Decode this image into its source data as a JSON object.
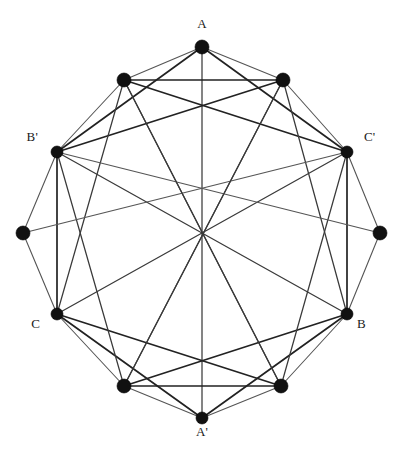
{
  "figure": {
    "type": "graph-diagram",
    "title": "",
    "background_color": "#ffffff",
    "edge_color": "#3a3a3a",
    "vertex_color": "#111111",
    "width": 402,
    "height": 469
  },
  "chart_data": {
    "type": "scatter",
    "title": "",
    "xlabel": "",
    "ylabel": "",
    "layout": {
      "center_x": 202,
      "center_y": 233,
      "radius": 186,
      "vertex_count": 12,
      "labeled_vertex_count": 6,
      "grid": false,
      "legend": "none"
    },
    "vertices": [
      {
        "id": "v0",
        "label": "A",
        "label_shown": true,
        "angle_deg": 90,
        "x": 202,
        "y": 47,
        "radius": 7.0,
        "label_x": 202,
        "label_y": 24,
        "label_anchor": "center"
      },
      {
        "id": "v1",
        "label": "",
        "label_shown": false,
        "angle_deg": 60,
        "x": 283,
        "y": 80,
        "radius": 7.0,
        "label_x": 0,
        "label_y": 0,
        "label_anchor": "center"
      },
      {
        "id": "v2",
        "label": "C'",
        "label_shown": true,
        "angle_deg": 30,
        "x": 347,
        "y": 152,
        "radius": 6.0,
        "label_x": 364,
        "label_y": 137,
        "label_anchor": "left"
      },
      {
        "id": "v3",
        "label": "",
        "label_shown": false,
        "angle_deg": 0,
        "x": 380,
        "y": 233,
        "radius": 7.0,
        "label_x": 0,
        "label_y": 0,
        "label_anchor": "center"
      },
      {
        "id": "v4",
        "label": "B",
        "label_shown": true,
        "angle_deg": -30,
        "x": 347,
        "y": 314,
        "radius": 6.0,
        "label_x": 357,
        "label_y": 324,
        "label_anchor": "left"
      },
      {
        "id": "v5",
        "label": "",
        "label_shown": false,
        "angle_deg": -60,
        "x": 281,
        "y": 386,
        "radius": 7.0,
        "label_x": 0,
        "label_y": 0,
        "label_anchor": "center"
      },
      {
        "id": "v6",
        "label": "A'",
        "label_shown": true,
        "angle_deg": -90,
        "x": 202,
        "y": 418,
        "radius": 6.0,
        "label_x": 202,
        "label_y": 432,
        "label_anchor": "center"
      },
      {
        "id": "v7",
        "label": "",
        "label_shown": false,
        "angle_deg": -120,
        "x": 124,
        "y": 386,
        "radius": 7.0,
        "label_x": 0,
        "label_y": 0,
        "label_anchor": "center"
      },
      {
        "id": "v8",
        "label": "C",
        "label_shown": true,
        "angle_deg": -150,
        "x": 57,
        "y": 314,
        "radius": 6.0,
        "label_x": 40,
        "label_y": 324,
        "label_anchor": "right"
      },
      {
        "id": "v9",
        "label": "",
        "label_shown": false,
        "angle_deg": 180,
        "x": 23,
        "y": 233,
        "radius": 7.0,
        "label_x": 0,
        "label_y": 0,
        "label_anchor": "center"
      },
      {
        "id": "v10",
        "label": "B'",
        "label_shown": true,
        "angle_deg": 150,
        "x": 57,
        "y": 152,
        "radius": 6.0,
        "label_x": 38,
        "label_y": 137,
        "label_anchor": "right"
      },
      {
        "id": "v11",
        "label": "",
        "label_shown": false,
        "angle_deg": 120,
        "x": 124,
        "y": 80,
        "radius": 7.0,
        "label_x": 0,
        "label_y": 0,
        "label_anchor": "center"
      }
    ],
    "edges": [
      {
        "from": "v0",
        "to": "v1",
        "weight": "light"
      },
      {
        "from": "v1",
        "to": "v2",
        "weight": "light"
      },
      {
        "from": "v2",
        "to": "v3",
        "weight": "light"
      },
      {
        "from": "v3",
        "to": "v4",
        "weight": "light"
      },
      {
        "from": "v4",
        "to": "v5",
        "weight": "light"
      },
      {
        "from": "v5",
        "to": "v6",
        "weight": "light"
      },
      {
        "from": "v6",
        "to": "v7",
        "weight": "light"
      },
      {
        "from": "v7",
        "to": "v8",
        "weight": "light"
      },
      {
        "from": "v8",
        "to": "v9",
        "weight": "light"
      },
      {
        "from": "v9",
        "to": "v10",
        "weight": "light"
      },
      {
        "from": "v10",
        "to": "v11",
        "weight": "light"
      },
      {
        "from": "v11",
        "to": "v0",
        "weight": "light"
      },
      {
        "from": "v0",
        "to": "v6",
        "weight": "normal"
      },
      {
        "from": "v1",
        "to": "v7",
        "weight": "normal"
      },
      {
        "from": "v2",
        "to": "v8",
        "weight": "normal"
      },
      {
        "from": "v4",
        "to": "v10",
        "weight": "normal"
      },
      {
        "from": "v5",
        "to": "v11",
        "weight": "normal"
      },
      {
        "from": "v0",
        "to": "v2",
        "weight": "heavy"
      },
      {
        "from": "v0",
        "to": "v10",
        "weight": "heavy"
      },
      {
        "from": "v6",
        "to": "v4",
        "weight": "heavy"
      },
      {
        "from": "v6",
        "to": "v8",
        "weight": "heavy"
      },
      {
        "from": "v1",
        "to": "v10",
        "weight": "heavy"
      },
      {
        "from": "v11",
        "to": "v2",
        "weight": "heavy"
      },
      {
        "from": "v5",
        "to": "v8",
        "weight": "heavy"
      },
      {
        "from": "v7",
        "to": "v4",
        "weight": "heavy"
      },
      {
        "from": "v1",
        "to": "v11",
        "weight": "heavy"
      },
      {
        "from": "v5",
        "to": "v7",
        "weight": "heavy"
      },
      {
        "from": "v2",
        "to": "v4",
        "weight": "heavy"
      },
      {
        "from": "v8",
        "to": "v10",
        "weight": "heavy"
      },
      {
        "from": "v11",
        "to": "v8",
        "weight": "normal"
      },
      {
        "from": "v1",
        "to": "v4",
        "weight": "normal"
      },
      {
        "from": "v10",
        "to": "v7",
        "weight": "normal"
      },
      {
        "from": "v2",
        "to": "v5",
        "weight": "normal"
      },
      {
        "from": "v10",
        "to": "v3",
        "weight": "light"
      },
      {
        "from": "v2",
        "to": "v9",
        "weight": "light"
      },
      {
        "from": "v11",
        "to": "v5",
        "weight": "normal"
      },
      {
        "from": "v1",
        "to": "v7",
        "weight": "normal"
      }
    ]
  }
}
